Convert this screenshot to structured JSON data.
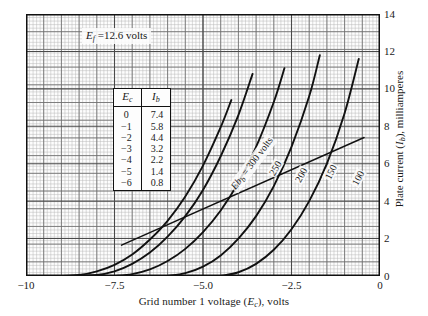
{
  "chart_data": {
    "type": "line",
    "title": "",
    "xlabel": "Grid number 1 voltage (Ec), volts",
    "ylabel": "Plate current (Ib), milliamperes",
    "xlim": [
      -10,
      0
    ],
    "ylim": [
      0,
      14
    ],
    "xticks": [
      -10,
      -7.5,
      -5.0,
      -2.5,
      0
    ],
    "xticklabels": [
      "-10",
      "-7.5",
      "-5.0",
      "-2.5",
      "0"
    ],
    "yticks": [
      0,
      2,
      4,
      6,
      8,
      10,
      12,
      14
    ],
    "yticklabels": [
      "0",
      "2",
      "4",
      "6",
      "8",
      "10",
      "12",
      "14"
    ],
    "grid": true,
    "grid_minor_step_x": 0.1,
    "grid_minor_step_y": 0.14,
    "legend_position": "inline-curve-labels",
    "annotations": [
      {
        "name": "filament-voltage",
        "text": "Ef = 12.6 volts",
        "x": -7.4,
        "y": 13.0
      }
    ],
    "series": [
      {
        "name": "Eb = 300 volts",
        "label": "300",
        "x": [
          -10.0,
          -9.0,
          -8.5,
          -8.0,
          -7.5,
          -7.0,
          -6.5,
          -6.0,
          -5.5,
          -5.0,
          -4.5,
          -4.2
        ],
        "y": [
          0.0,
          0.0,
          0.05,
          0.25,
          0.6,
          1.15,
          1.95,
          2.95,
          4.25,
          5.9,
          7.95,
          9.4
        ]
      },
      {
        "name": "Eb = 250 volts",
        "label": "250",
        "x": [
          -9.0,
          -8.0,
          -7.5,
          -7.0,
          -6.5,
          -6.0,
          -5.5,
          -5.0,
          -4.5,
          -4.0,
          -3.6
        ],
        "y": [
          0.0,
          0.05,
          0.25,
          0.65,
          1.25,
          2.1,
          3.2,
          4.6,
          6.4,
          8.6,
          10.8
        ]
      },
      {
        "name": "Eb = 200 volts",
        "label": "200",
        "x": [
          -7.5,
          -7.0,
          -6.5,
          -6.0,
          -5.5,
          -5.0,
          -4.5,
          -4.0,
          -3.5,
          -3.0,
          -2.7
        ],
        "y": [
          0.0,
          0.1,
          0.35,
          0.8,
          1.45,
          2.35,
          3.5,
          5.0,
          6.9,
          9.3,
          11.1
        ]
      },
      {
        "name": "Eb = 150 volts",
        "label": "150",
        "x": [
          -6.0,
          -5.5,
          -5.0,
          -4.5,
          -4.0,
          -3.5,
          -3.0,
          -2.5,
          -2.0,
          -1.7
        ],
        "y": [
          0.0,
          0.15,
          0.5,
          1.1,
          2.0,
          3.2,
          4.8,
          6.9,
          9.6,
          11.8
        ]
      },
      {
        "name": "Eb = 100 volts",
        "label": "100",
        "x": [
          -4.5,
          -4.0,
          -3.5,
          -3.0,
          -2.5,
          -2.0,
          -1.5,
          -1.0,
          -0.6
        ],
        "y": [
          0.0,
          0.2,
          0.65,
          1.4,
          2.5,
          4.0,
          6.0,
          8.7,
          11.6
        ]
      },
      {
        "name": "load-line",
        "label": "",
        "straight": true,
        "x": [
          -7.3,
          -0.45
        ],
        "y": [
          1.65,
          7.4
        ]
      }
    ],
    "curve_labels": [
      {
        "name": "curve-label-300",
        "text_italic": "Eb",
        "text": " = 300 volts",
        "x_px": 233,
        "y_px": 183,
        "angle": -53
      },
      {
        "name": "curve-label-250",
        "text_italic": "",
        "text": "250",
        "x_px": 271,
        "y_px": 170,
        "angle": -60
      },
      {
        "name": "curve-label-200",
        "text_italic": "",
        "text": "200",
        "x_px": 297,
        "y_px": 177,
        "angle": -62
      },
      {
        "name": "curve-label-150",
        "text_italic": "",
        "text": "150",
        "x_px": 327,
        "y_px": 174,
        "angle": -64
      },
      {
        "name": "curve-label-100",
        "text_italic": "",
        "text": "100",
        "x_px": 354,
        "y_px": 180,
        "angle": -62
      }
    ],
    "table": {
      "name": "operating-point-table",
      "headers": [
        "Ec",
        "Ib"
      ],
      "rows": [
        [
          "0",
          "7.4"
        ],
        [
          "-1",
          "5.8"
        ],
        [
          "-2",
          "4.4"
        ],
        [
          "-3",
          "3.2"
        ],
        [
          "-4",
          "2.2"
        ],
        [
          "-5",
          "1.4"
        ],
        [
          "-6",
          "0.8"
        ]
      ]
    },
    "colors": {
      "curve": "#111111",
      "grid_minor": "#b9b9b9",
      "grid_major": "#6e6e6e",
      "frame": "#111111",
      "background": "#fdfdfd",
      "text": "#1a1a1a"
    }
  },
  "axes": {
    "x_title_parts": {
      "pre": "Grid number 1 voltage (",
      "sym": "E",
      "sub": "c",
      "post": "), volts"
    },
    "y_title_parts": {
      "pre": "Plate current (",
      "sym": "I",
      "sub": "b",
      "post": "), milliamperes"
    }
  },
  "annotation_ef": {
    "sym": "E",
    "sub": "f",
    "rest": " =12.6 volts"
  }
}
